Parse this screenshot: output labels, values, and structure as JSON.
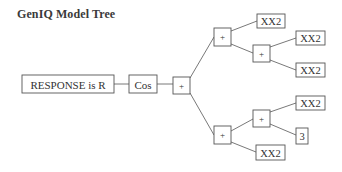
{
  "title": "GenIQ Model Tree",
  "tree": {
    "output": {
      "id": "n0",
      "label": "RESPONSE is R"
    },
    "nodes": [
      {
        "id": "n1",
        "label": "Cos",
        "type": "function"
      },
      {
        "id": "n2",
        "label": "+",
        "type": "operator"
      },
      {
        "id": "n3",
        "label": "+",
        "type": "operator"
      },
      {
        "id": "n4",
        "label": "XX2",
        "type": "variable"
      },
      {
        "id": "n5",
        "label": "+",
        "type": "operator"
      },
      {
        "id": "n6",
        "label": "XX2",
        "type": "variable"
      },
      {
        "id": "n7",
        "label": "XX2",
        "type": "variable"
      },
      {
        "id": "n8",
        "label": "+",
        "type": "operator"
      },
      {
        "id": "n9",
        "label": "+",
        "type": "operator"
      },
      {
        "id": "n10",
        "label": "XX2",
        "type": "variable"
      },
      {
        "id": "n11",
        "label": "3",
        "type": "constant"
      },
      {
        "id": "n12",
        "label": "XX2",
        "type": "variable"
      }
    ],
    "edges": [
      [
        "n0",
        "n1"
      ],
      [
        "n1",
        "n2"
      ],
      [
        "n2",
        "n3"
      ],
      [
        "n2",
        "n8"
      ],
      [
        "n3",
        "n4"
      ],
      [
        "n3",
        "n5"
      ],
      [
        "n5",
        "n6"
      ],
      [
        "n5",
        "n7"
      ],
      [
        "n8",
        "n9"
      ],
      [
        "n8",
        "n12"
      ],
      [
        "n9",
        "n10"
      ],
      [
        "n9",
        "n11"
      ]
    ]
  }
}
